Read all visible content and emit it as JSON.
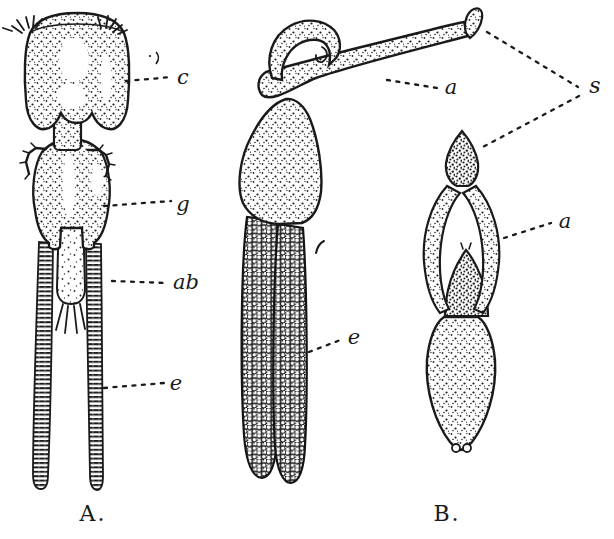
{
  "plate": {
    "paper_color": "#ffffff",
    "ink_color": "#1a1a1a",
    "figure_a": {
      "caption": "A.",
      "labels": {
        "c": "c",
        "g": "g",
        "ab": "ab",
        "e": "e"
      }
    },
    "figure_b": {
      "caption": "B.",
      "labels": {
        "a_upper": "a",
        "s": "s",
        "e": "e",
        "a_lower": "a"
      }
    }
  }
}
